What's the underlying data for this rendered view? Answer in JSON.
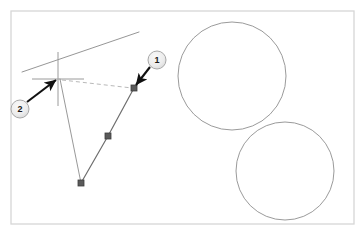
{
  "figure": {
    "background_color": "#ffffff",
    "frame": {
      "name": "drawing-frame",
      "x": 11,
      "y": 11,
      "width": 343,
      "height": 213,
      "border_color": "#d6d6d6",
      "fill_color": "#ffffff"
    }
  },
  "geometry": {
    "polyline": {
      "name": "polyline",
      "stroke_color": "#6e6e6e",
      "stroke_width": 1.2,
      "points": [
        {
          "label": "vertex-top-right",
          "x": 134,
          "y": 88
        },
        {
          "label": "vertex-middle",
          "x": 108,
          "y": 136
        },
        {
          "label": "vertex-bottom",
          "x": 81,
          "y": 183
        }
      ]
    },
    "vertex_markers": {
      "name": "vertex-square-marker",
      "shape": "square",
      "size": 6,
      "fill_color": "#5a5a5a",
      "stroke_color": "#3c3c3c"
    },
    "leader_line": {
      "name": "leader-line",
      "stroke_color": "#8c8c8c",
      "stroke_width": 0.9,
      "from": {
        "x": 60,
        "y": 79
      },
      "to": {
        "x": 81,
        "y": 183
      }
    },
    "tangent_line": {
      "name": "tangent-line",
      "stroke_color": "#8a8a8a",
      "stroke_width": 0.9,
      "from": {
        "x": 22,
        "y": 72
      },
      "to": {
        "x": 139,
        "y": 32
      }
    },
    "dashed_alignment_line": {
      "name": "dashed-alignment-line",
      "stroke_color": "#b9b9b9",
      "stroke_width": 1,
      "dash_pattern": "4 3",
      "from": {
        "x": 62,
        "y": 80
      },
      "to": {
        "x": 132,
        "y": 88
      }
    },
    "snap_cross": {
      "name": "snap-cross-marker",
      "stroke_color": "#9a9a9a",
      "stroke_width": 1,
      "center": {
        "x": 58,
        "y": 79
      },
      "horizontal": {
        "x1": 32,
        "y1": 79,
        "x2": 84,
        "y2": 79
      },
      "vertical": {
        "x1": 58,
        "y1": 52,
        "x2": 58,
        "y2": 106
      }
    },
    "circles": [
      {
        "name": "circle-upper",
        "cx": 232,
        "cy": 76,
        "r": 54,
        "stroke_color": "#8f8f8f",
        "stroke_width": 0.9,
        "fill": "none"
      },
      {
        "name": "circle-lower",
        "cx": 285,
        "cy": 171,
        "r": 49,
        "stroke_color": "#8f8f8f",
        "stroke_width": 0.9,
        "fill": "none"
      }
    ]
  },
  "callouts": [
    {
      "id": "callout-1",
      "label": "1",
      "badge": {
        "cx": 157,
        "cy": 60,
        "r": 9,
        "fill_color": "#ebebeb",
        "stroke_color": "#a8a8a8",
        "text_color": "#1a1a1a"
      },
      "arrow": {
        "name": "callout-1-arrow",
        "from": {
          "x": 150,
          "y": 67
        },
        "to": {
          "x": 136,
          "y": 85
        },
        "color": "#111111"
      }
    },
    {
      "id": "callout-2",
      "label": "2",
      "badge": {
        "cx": 20,
        "cy": 109,
        "r": 9,
        "fill_color": "#ebebeb",
        "stroke_color": "#a8a8a8",
        "text_color": "#1a1a1a"
      },
      "arrow": {
        "name": "callout-2-arrow",
        "from": {
          "x": 27,
          "y": 102
        },
        "to": {
          "x": 56,
          "y": 80
        },
        "color": "#111111"
      }
    }
  ]
}
